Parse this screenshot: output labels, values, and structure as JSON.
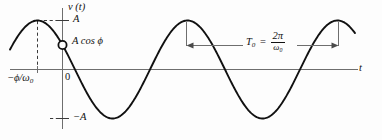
{
  "figure": {
    "type": "sinusoid-plot",
    "background": "#fdfdfd",
    "curve_color": "#111111",
    "axis_color": "#6e6e6e",
    "annotation_color": "#6e6e6e",
    "labels": {
      "y_axis": "v (t)",
      "x_axis": "t",
      "amplitude_positive": "A",
      "amplitude_negative": "−A",
      "origin": "0",
      "marker_value": "A cos ϕ",
      "phase_offset_sign": "−",
      "phase_offset_num": "ϕ/ω",
      "phase_offset_sub": "0",
      "period_symbol": "T",
      "period_sub": "0",
      "period_equals": "=",
      "period_numerator": "2π",
      "period_denominator_base": "ω",
      "period_denominator_sub": "0"
    }
  },
  "chart_data": {
    "type": "line",
    "title": "",
    "xlabel": "t",
    "ylabel": "v (t)",
    "function": "v(t) = A cos(ω₀ t + ϕ)",
    "amplitude": 1,
    "period": 1,
    "phase_shift_fraction_of_period": -0.1667,
    "ylim": [
      -1.28,
      1.28
    ],
    "xlim": [
      -0.35,
      1.95
    ],
    "grid": false,
    "legend": null,
    "y_ticks": [
      {
        "value": 1,
        "label": "A"
      },
      {
        "value": 0,
        "label": "0"
      },
      {
        "value": -1,
        "label": "−A"
      }
    ],
    "x_ticks": [
      {
        "value": -0.1667,
        "label": "−ϕ/ω₀"
      },
      {
        "value": 0,
        "label": "0"
      }
    ],
    "markers": [
      {
        "x": 0,
        "y": 0.5,
        "label": "A cos ϕ",
        "style": "open-circle"
      }
    ],
    "annotations": [
      {
        "kind": "double-arrow",
        "label": "T₀ = 2π/ω₀",
        "from_x": 0.8333,
        "to_x": 1.8333,
        "at_y": 0.5
      }
    ],
    "guides": [
      {
        "kind": "dashed-vertical",
        "x": -0.1667,
        "from_y": 0,
        "to_y": 1
      },
      {
        "kind": "dashed-horizontal",
        "y": 1,
        "from_x": -0.1667,
        "to_x": 0
      }
    ],
    "x": [
      -0.35,
      -0.3,
      -0.25,
      -0.2,
      -0.1667,
      -0.1,
      -0.05,
      0,
      0.0833,
      0.1667,
      0.25,
      0.3333,
      0.4167,
      0.5,
      0.5833,
      0.6667,
      0.75,
      0.8333,
      0.9167,
      1.0,
      1.0833,
      1.1667,
      1.25,
      1.3333,
      1.4167,
      1.5,
      1.5833,
      1.6667,
      1.75,
      1.8333,
      1.9167,
      1.95
    ],
    "y": [
      0.4818,
      0.6494,
      0.7934,
      0.9068,
      0.9511,
      0.9511,
      0.8763,
      0.5,
      0.0,
      -0.5,
      -0.866,
      -1.0,
      -0.866,
      -0.5,
      0.0,
      0.5,
      0.866,
      1.0,
      0.866,
      0.5,
      0.0,
      -0.5,
      -0.866,
      -1.0,
      -0.866,
      -0.5,
      0.0,
      0.5,
      0.866,
      1.0,
      0.866,
      0.7934
    ]
  }
}
